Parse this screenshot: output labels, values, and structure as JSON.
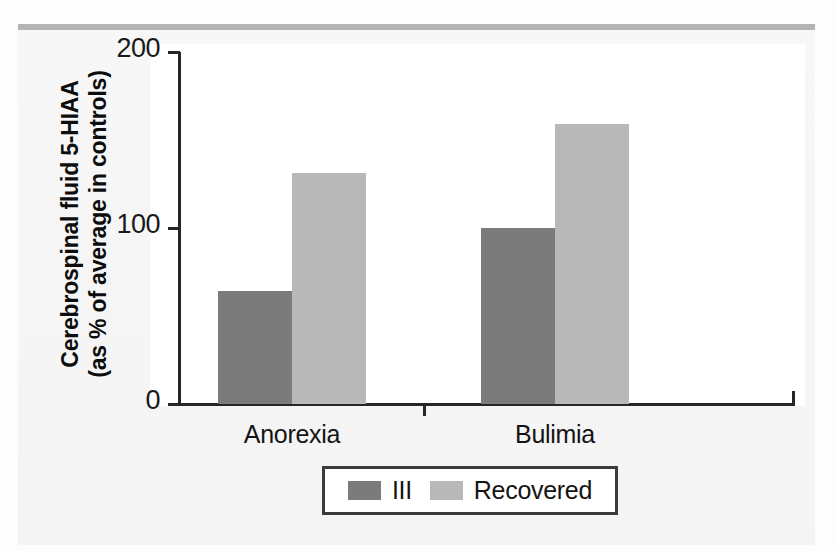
{
  "chart_data": {
    "type": "bar",
    "title": "",
    "xlabel": "",
    "ylabel": "Cerebrospinal fluid 5-HIAA (as % of average in controls)",
    "ylabel_line1": "Cerebrospinal fluid 5-HIAA",
    "ylabel_line2": "(as % of average in controls)",
    "categories": [
      "Anorexia",
      "Bulimia"
    ],
    "series": [
      {
        "name": "III",
        "color": "#7b7b7b",
        "values": [
          64,
          100
        ]
      },
      {
        "name": "Recovered",
        "color": "#b8b8b8",
        "values": [
          131,
          159
        ]
      }
    ],
    "ylim": [
      0,
      200
    ],
    "yticks": [
      0,
      100,
      200
    ],
    "ytick_labels": [
      "0",
      "100",
      "200"
    ],
    "grid": false,
    "legend_position": "bottom-center"
  },
  "legend": {
    "items": [
      {
        "label": "III",
        "color": "#7b7b7b"
      },
      {
        "label": "Recovered",
        "color": "#b8b8b8"
      }
    ]
  },
  "colors": {
    "ill": "#7b7b7b",
    "recovered": "#b8b8b8",
    "axis": "#262626",
    "rule": "#b4b4b4",
    "panel": "#ffffff"
  }
}
